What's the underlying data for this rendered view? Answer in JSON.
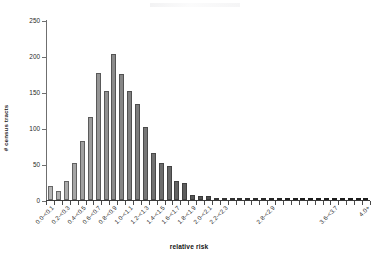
{
  "chart_data": {
    "type": "bar",
    "title": "",
    "xlabel": "relative risk",
    "ylabel": "# census tracts",
    "ylim": [
      0,
      250
    ],
    "ytick_values": [
      0,
      50,
      100,
      150,
      200,
      250
    ],
    "ytick_labels": [
      "0",
      "50",
      "100",
      "150",
      "200",
      "250"
    ],
    "grid": false,
    "legend": "none",
    "bar_edge_color": "#3c3c3c",
    "color_gradient_from": "#b4b4b4",
    "color_gradient_to": "#101010",
    "categories": [
      "0.0-<0.1",
      "0.1-<0.2",
      "0.2-<0.3",
      "0.3-<0.4",
      "0.4-<0.5",
      "0.5-<0.6",
      "0.6-<0.7",
      "0.7-<0.8",
      "0.8-<0.9",
      "0.9-<1.0",
      "1.0-<1.1",
      "1.1-<1.2",
      "1.2-<1.3",
      "1.3-<1.4",
      "1.4-<1.5",
      "1.5-<1.6",
      "1.6-<1.7",
      "1.7-<1.8",
      "1.8-<1.9",
      "1.9-<2.0",
      "2.0-<2.1",
      "2.1-<2.2",
      "2.2-<2.3",
      "2.3-<2.4",
      "2.4-<2.5",
      "2.5-<2.6",
      "2.6-<2.7",
      "2.7-<2.8",
      "2.8-<2.9",
      "2.9-<3.0",
      "3.0-<3.1",
      "3.1-<3.2",
      "3.2-<3.3",
      "3.3-<3.4",
      "3.4-<3.5",
      "3.5-<3.6",
      "3.6-<3.7",
      "3.7-<3.8",
      "3.8-<3.9",
      "3.9-<4.0",
      "4.0+"
    ],
    "visible_tick_labels": [
      {
        "index": 0,
        "label": "0.0-<0.1"
      },
      {
        "index": 2,
        "label": "0.2-<0.3"
      },
      {
        "index": 4,
        "label": "0.4-<0.5"
      },
      {
        "index": 6,
        "label": "0.6-<0.7"
      },
      {
        "index": 8,
        "label": "0.8-<0.9"
      },
      {
        "index": 10,
        "label": "1.0-<1.1"
      },
      {
        "index": 12,
        "label": "1.2-<1.3"
      },
      {
        "index": 14,
        "label": "1.4-<1.5"
      },
      {
        "index": 16,
        "label": "1.6-<1.7"
      },
      {
        "index": 18,
        "label": "1.8-<1.9"
      },
      {
        "index": 20,
        "label": "2.0-<2.1"
      },
      {
        "index": 22,
        "label": "2.2-<2.3"
      },
      {
        "index": 28,
        "label": "2.8-<2.9"
      },
      {
        "index": 36,
        "label": "3.6-<3.7"
      },
      {
        "index": 40,
        "label": "4.0+"
      }
    ],
    "values": [
      19,
      12,
      27,
      52,
      82,
      115,
      177,
      152,
      203,
      175,
      152,
      133,
      102,
      65,
      51,
      47,
      26,
      23,
      7,
      6,
      6,
      1,
      1,
      1,
      1,
      1,
      1,
      1,
      1,
      1,
      1,
      1,
      1,
      1,
      1,
      1,
      1,
      1,
      1,
      1,
      3
    ]
  }
}
